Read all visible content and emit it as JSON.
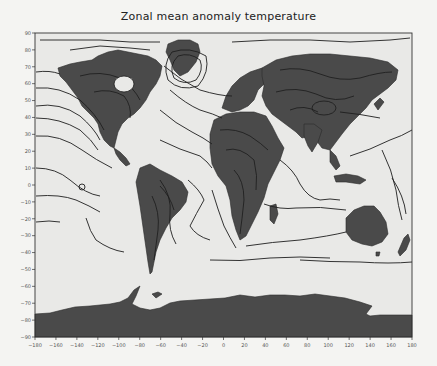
{
  "title": "Zonal mean anomaly temperature",
  "colors": {
    "background": "#f4f4f2",
    "ocean": "#e9e9e7",
    "land": "#4a4a4a",
    "contour": "#1e1e1e",
    "axis": "#333333"
  },
  "frame": {
    "x0": 35,
    "x1": 412,
    "y0": 33,
    "y1": 337
  },
  "axes": {
    "x": {
      "min": -180,
      "max": 180,
      "ticks": [
        -180,
        -160,
        -140,
        -120,
        -100,
        -80,
        -60,
        -40,
        -20,
        0,
        20,
        40,
        60,
        80,
        100,
        120,
        140,
        160,
        180
      ]
    },
    "y": {
      "min": -90,
      "max": 90,
      "ticks": [
        90,
        80,
        70,
        60,
        50,
        40,
        30,
        20,
        10,
        0,
        -10,
        -20,
        -30,
        -40,
        -50,
        -60,
        -70,
        -80,
        -90
      ]
    }
  },
  "contour_labels": [
    "-1",
    "-1",
    "-5",
    "-3",
    "5",
    "1",
    "3",
    "-2",
    "2",
    "0"
  ]
}
